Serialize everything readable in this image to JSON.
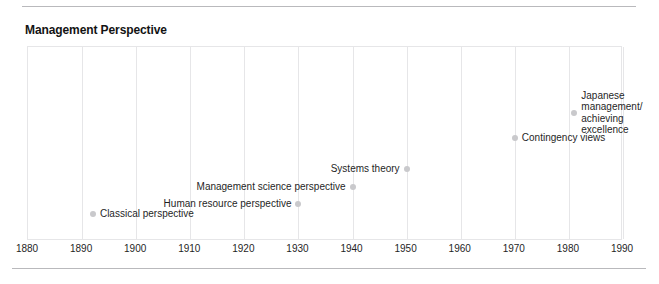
{
  "chart_data": {
    "type": "scatter",
    "title": "Management Perspective",
    "xlabel": "",
    "ylabel": "",
    "xlim": [
      1880,
      1990
    ],
    "ylim": [
      0,
      1
    ],
    "grid": true,
    "legend": false,
    "xticks": [
      1880,
      1890,
      1900,
      1910,
      1920,
      1930,
      1940,
      1950,
      1960,
      1970,
      1980,
      1990
    ],
    "points": [
      {
        "label": "Classical perspective",
        "x": 1892,
        "y": 0.14,
        "label_side": "right"
      },
      {
        "label": "Human resource perspective",
        "x": 1930,
        "y": 0.19,
        "label_side": "left"
      },
      {
        "label": "Management science perspective",
        "x": 1940,
        "y": 0.28,
        "label_side": "left"
      },
      {
        "label": "Systems theory",
        "x": 1950,
        "y": 0.37,
        "label_side": "left"
      },
      {
        "label": "Contingency views",
        "x": 1970,
        "y": 0.53,
        "label_side": "right"
      },
      {
        "label": "Japanese management/\nachieving\nexcellence",
        "x": 1981,
        "y": 0.66,
        "label_side": "right"
      }
    ],
    "colors": {
      "marker": "#c9c9cc",
      "grid": "#e6e6e8",
      "text": "#1f1f1f",
      "rule": "#b9b9bc"
    }
  }
}
